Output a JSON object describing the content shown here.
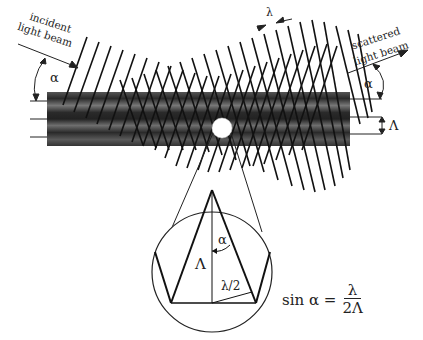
{
  "figure": {
    "type": "optical scattering diagram (Bragg condition for light scattering on a grating-like interference pattern)",
    "labels": {
      "incident_beam": [
        "incident",
        "light beam"
      ],
      "scattered_beam": [
        "scattered",
        "light beam"
      ],
      "angle_left": "α",
      "angle_right": "α",
      "wavelength": "λ",
      "fringe_spacing": "Λ"
    },
    "inset": {
      "spacing_label": "Λ",
      "angle_label": "α",
      "half_wavelength_label": "λ/2"
    },
    "formula": {
      "lhs": "sin α =",
      "numerator": "λ",
      "denominator": "2Λ"
    },
    "colors": {
      "ink": "#1a1a1a",
      "beam_dark": "#2b2b2b",
      "beam_mid": "#6a6a6a",
      "particle": "#ffffff",
      "background": "#ffffff"
    }
  }
}
